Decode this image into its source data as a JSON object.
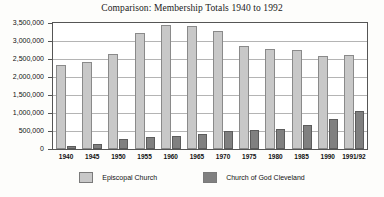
{
  "chart_data": {
    "type": "bar",
    "title": "Comparison: Membership Totals 1940 to 1992",
    "xlabel": "",
    "ylabel": "",
    "ylim": [
      0,
      3500000
    ],
    "ytick_labels": [
      "3,500,000",
      "3,000,000",
      "2,500,000",
      "2,000,000",
      "1,500,000",
      "1,000,000",
      "500,000",
      "0"
    ],
    "ytick_values": [
      3500000,
      3000000,
      2500000,
      2000000,
      1500000,
      1000000,
      500000,
      0
    ],
    "grid": true,
    "legend_position": "bottom",
    "categories": [
      "1940",
      "1945",
      "1950",
      "1955",
      "1960",
      "1965",
      "1970",
      "1975",
      "1980",
      "1985",
      "1990",
      "1991/92"
    ],
    "series": [
      {
        "name": "Episcopal Church",
        "color": "#c8c8c8",
        "values": [
          2340000,
          2420000,
          2640000,
          3210000,
          3440000,
          3430000,
          3290000,
          2860000,
          2790000,
          2740000,
          2570000,
          2600000
        ]
      },
      {
        "name": "Church of God Cleveland",
        "color": "#808080",
        "values": [
          80000,
          130000,
          270000,
          320000,
          350000,
          410000,
          490000,
          520000,
          560000,
          670000,
          840000,
          1050000
        ]
      }
    ]
  },
  "legend": {
    "items": [
      {
        "label": "Episcopal Church",
        "swatch": "light"
      },
      {
        "label": "Church of God Cleveland",
        "swatch": "dark"
      }
    ]
  }
}
